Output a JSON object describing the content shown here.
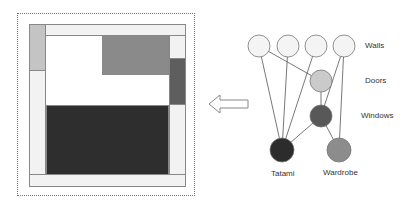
{
  "diagram": {
    "left_panel": "floor-plan layout",
    "right_panel": "room element graph",
    "arrow_direction": "left"
  },
  "floor_plan": {
    "frame": {
      "x": 17,
      "y": 13,
      "w": 178,
      "h": 183,
      "style": "dotted"
    },
    "elements": [
      {
        "name": "room-outline",
        "x": 29,
        "y": 24,
        "w": 157,
        "h": 163,
        "color": "#ffffff"
      },
      {
        "name": "wall-top",
        "x": 29,
        "y": 24,
        "w": 157,
        "h": 12,
        "color": "#f2f2f2"
      },
      {
        "name": "wall-bottom",
        "x": 29,
        "y": 174,
        "w": 157,
        "h": 13,
        "color": "#f2f2f2"
      },
      {
        "name": "wall-left",
        "x": 29,
        "y": 24,
        "w": 17,
        "h": 151,
        "color": "#f2f2f2"
      },
      {
        "name": "wall-right",
        "x": 169,
        "y": 35,
        "w": 17,
        "h": 140,
        "color": "#f2f2f2"
      },
      {
        "name": "door",
        "x": 29,
        "y": 24,
        "w": 17,
        "h": 47,
        "color": "#c4c4c4"
      },
      {
        "name": "window",
        "x": 169,
        "y": 58,
        "w": 17,
        "h": 47,
        "color": "#5e5e5e"
      },
      {
        "name": "wardrobe",
        "x": 102,
        "y": 35,
        "w": 67,
        "h": 40,
        "color": "#8a8a8a"
      },
      {
        "name": "tatami",
        "x": 46,
        "y": 105,
        "w": 123,
        "h": 70,
        "color": "#2e2e2e"
      }
    ]
  },
  "graph": {
    "nodes": [
      {
        "id": "wall1",
        "x": 259,
        "y": 46,
        "r": 11,
        "color": "#f4f4f4"
      },
      {
        "id": "wall2",
        "x": 288,
        "y": 46,
        "r": 11,
        "color": "#f4f4f4"
      },
      {
        "id": "wall3",
        "x": 316,
        "y": 46,
        "r": 11,
        "color": "#f4f4f4"
      },
      {
        "id": "wall4",
        "x": 344,
        "y": 46,
        "r": 11,
        "color": "#f4f4f4"
      },
      {
        "id": "door",
        "x": 321,
        "y": 81,
        "r": 11,
        "color": "#cacaca"
      },
      {
        "id": "window",
        "x": 321,
        "y": 116,
        "r": 11,
        "color": "#585858"
      },
      {
        "id": "tatami",
        "x": 282,
        "y": 150,
        "r": 12,
        "color": "#2c2c2c"
      },
      {
        "id": "wardrobe",
        "x": 339,
        "y": 150,
        "r": 12,
        "color": "#8c8c8c"
      }
    ],
    "edges": [
      [
        "wall1",
        "tatami"
      ],
      [
        "wall2",
        "tatami"
      ],
      [
        "wall3",
        "tatami"
      ],
      [
        "wall1",
        "door"
      ],
      [
        "wall4",
        "window"
      ],
      [
        "wall4",
        "wardrobe"
      ],
      [
        "door",
        "window"
      ],
      [
        "window",
        "tatami"
      ],
      [
        "window",
        "wardrobe"
      ]
    ],
    "labels": {
      "walls": "Walls",
      "doors": "Doors",
      "windows": "Windows",
      "tatami": "Tatami",
      "wardrobe": "Wardrobe"
    }
  }
}
